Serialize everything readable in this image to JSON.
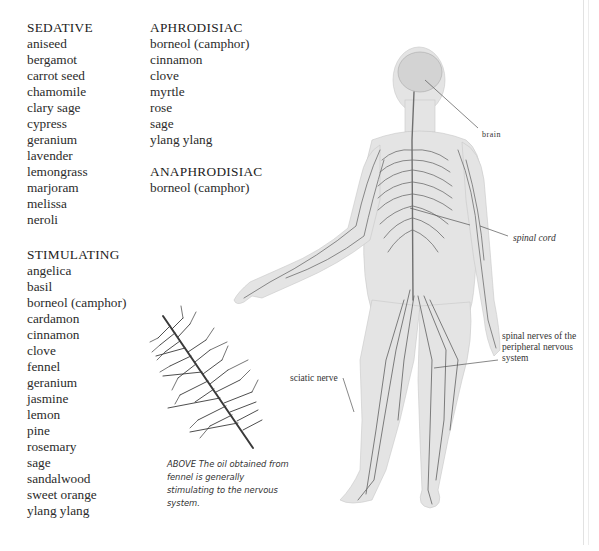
{
  "lists": {
    "sedative": {
      "heading": "SEDATIVE",
      "items": [
        "aniseed",
        "bergamot",
        "carrot seed",
        "chamomile",
        "clary sage",
        "cypress",
        "geranium",
        "lavender",
        "lemongrass",
        "marjoram",
        "melissa",
        "neroli"
      ]
    },
    "stimulating": {
      "heading": "STIMULATING",
      "items": [
        "angelica",
        "basil",
        "borneol (camphor)",
        "cardamon",
        "cinnamon",
        "clove",
        "fennel",
        "geranium",
        "jasmine",
        "lemon",
        "pine",
        "rosemary",
        "sage",
        "sandalwood",
        "sweet orange",
        "ylang ylang"
      ]
    },
    "aphrodisiac": {
      "heading": "APHRODISIAC",
      "items": [
        "borneol (camphor)",
        "cinnamon",
        "clove",
        "myrtle",
        "rose",
        "sage",
        "ylang ylang"
      ]
    },
    "anaphrodisiac": {
      "heading": "ANAPHRODISIAC",
      "items": [
        "borneol (camphor)"
      ]
    }
  },
  "fennel_figure": {
    "caption": "ABOVE The oil obtained from fennel is generally stimulating to the nervous system."
  },
  "body_figure": {
    "labels": {
      "brain": "brain",
      "spinal_cord": "spinal cord",
      "spinal_nerves": "spinal nerves of the peripheral nervous system",
      "sciatic_nerve": "sciatic nerve"
    }
  },
  "colors": {
    "text": "#2b2b2b",
    "skin": "#e6e6e6",
    "nerve": "#6f6f6f",
    "leader_line": "#555555"
  }
}
